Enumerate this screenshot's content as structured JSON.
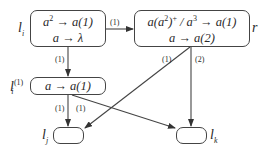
{
  "nodes": {
    "li": {
      "label": "l",
      "label_sub": "i",
      "rules": [
        "a² → a(1)",
        "a → λ"
      ]
    },
    "r": {
      "label": "r",
      "rules": [
        "a(a²)⁺ / a³ → a(1)",
        "a → a(2)"
      ]
    },
    "li1": {
      "label": "l",
      "label_sub": "i",
      "label_sup": "(1)",
      "rules": [
        "a → a(1)"
      ]
    },
    "lj": {
      "label": "l",
      "label_sub": "j",
      "rules": []
    },
    "lk": {
      "label": "l",
      "label_sub": "k",
      "rules": []
    }
  },
  "edges": [
    {
      "from": "li",
      "to": "r",
      "label": "(1)"
    },
    {
      "from": "li",
      "to": "li1",
      "label": "(1)"
    },
    {
      "from": "li1",
      "to": "lj",
      "label": "(1)"
    },
    {
      "from": "li1",
      "to": "lk",
      "label": "(1)"
    },
    {
      "from": "r",
      "to": "lj",
      "label": "(1)"
    },
    {
      "from": "r",
      "to": "lk",
      "label": "(2)"
    }
  ]
}
